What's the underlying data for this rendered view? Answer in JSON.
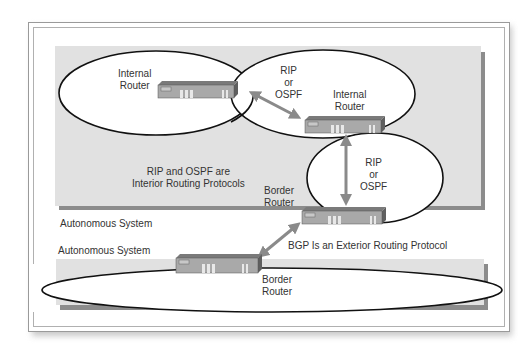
{
  "diagram": {
    "upper_as": {
      "label": "Autonomous System",
      "fill": "#e1e1e1",
      "shadow": "#8c8c8c"
    },
    "lower_as": {
      "label": "Autonomous System",
      "fill": "#e1e1e1",
      "shadow": "#8c8c8c"
    },
    "routers": [
      {
        "id": "internal-router-1",
        "line1": "Internal",
        "line2": "Router"
      },
      {
        "id": "internal-router-2",
        "line1": "Internal",
        "line2": "Router"
      },
      {
        "id": "border-router-upper",
        "line1": "Border",
        "line2": "Router"
      },
      {
        "id": "border-router-lower",
        "line1": "Border",
        "line2": "Router"
      }
    ],
    "links": [
      {
        "id": "link-1",
        "line1": "RIP",
        "line2": "or",
        "line3": "OSPF"
      },
      {
        "id": "link-2",
        "line1": "RIP",
        "line2": "or",
        "line3": "OSPF"
      }
    ],
    "notes": {
      "interior_line1": "RIP and OSPF are",
      "interior_line2": "Interior Routing Protocols",
      "exterior": "BGP Is an Exterior Routing Protocol"
    },
    "colors": {
      "arrow": "#8a8a8a",
      "router_front": "#a9a9a9",
      "router_top": "#7a7a7a",
      "router_side": "#5f5f5f",
      "ellipse_stroke": "#111111"
    }
  }
}
